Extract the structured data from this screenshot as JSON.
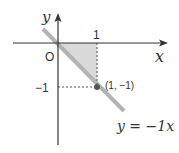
{
  "diagram": {
    "type": "coordinate-plane",
    "axes": {
      "x_label": "x",
      "y_label": "y",
      "origin_label": "O"
    },
    "ticks": {
      "x_tick_label": "1",
      "y_tick_label": "−1"
    },
    "line": {
      "equation_label": "y = −1x",
      "slope": -1,
      "color": "#b3b3b3"
    },
    "point": {
      "label": "(1, −1)",
      "x": 1,
      "y": -1,
      "color": "#555555"
    },
    "shaded_region": {
      "vertices": [
        [
          0,
          0
        ],
        [
          1,
          0
        ],
        [
          1,
          -1
        ]
      ],
      "color": "#d9d9d9"
    },
    "colors": {
      "axis": "#333333",
      "guide": "#555555"
    }
  }
}
